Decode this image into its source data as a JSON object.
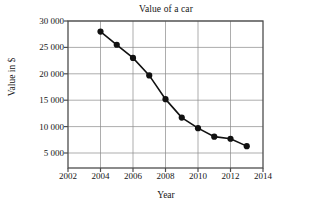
{
  "chart_data": {
    "type": "line",
    "title": "Value of a car",
    "xlabel": "Year",
    "ylabel": "Value in $",
    "x": [
      2004,
      2005,
      2006,
      2007,
      2008,
      2009,
      2010,
      2011,
      2012,
      2013
    ],
    "values": [
      28000,
      25500,
      23000,
      19700,
      15200,
      11700,
      9700,
      8100,
      7700,
      6300
    ],
    "series": [
      {
        "name": "Value of a car",
        "values": [
          28000,
          25500,
          23000,
          19700,
          15200,
          11700,
          9700,
          8100,
          7700,
          6300
        ]
      }
    ],
    "xlim": [
      2002,
      2014
    ],
    "ylim": [
      0,
      30000
    ],
    "xticks": [
      2002,
      2004,
      2006,
      2008,
      2010,
      2012,
      2014
    ],
    "xticklabels": [
      "2002",
      "2004",
      "2006",
      "2008",
      "2010",
      "2012",
      "2014"
    ],
    "yticks": [
      5000,
      10000,
      15000,
      20000,
      25000,
      30000
    ],
    "yticklabels": [
      "5 000",
      "10 000",
      "15 000",
      "20 000",
      "25 000",
      "30 000"
    ],
    "grid": true,
    "legend": false,
    "marker": "filled-circle",
    "line_color": "#111111",
    "grid_color": "#8a8a8a",
    "axis_color": "#4d4d4d"
  }
}
